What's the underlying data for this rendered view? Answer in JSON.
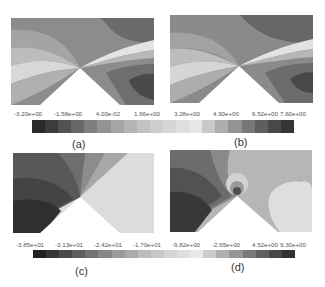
{
  "figure": {
    "panels": [
      {
        "id": "a",
        "label": "(a)"
      },
      {
        "id": "b",
        "label": "(b)"
      },
      {
        "id": "c",
        "label": "(c)"
      },
      {
        "id": "d",
        "label": "(d)"
      }
    ],
    "colorbar_top": {
      "ticks": [
        "-3.20e+00",
        "-1.58e+00",
        "4.00e-02",
        "1.66e+00",
        "3.28e+00",
        "4.90e+00",
        "6.52e+00",
        "7.60e+00"
      ],
      "colors": [
        "#2a2a2a",
        "#3c3c3c",
        "#525252",
        "#686868",
        "#7e7e7e",
        "#939393",
        "#a5a5a5",
        "#b4b4b4",
        "#c2c2c2",
        "#cdcdcd",
        "#d6d6d6",
        "#dedede",
        "#e6e6e6",
        "#c8c8c8",
        "#aeaeae",
        "#939393",
        "#777777",
        "#5e5e5e",
        "#484848",
        "#353535"
      ]
    },
    "colorbar_bottom": {
      "ticks": [
        "-3.85e+01",
        "-3.13e+01",
        "-2.42e+01",
        "-1.70e+01",
        "-9.82e+00",
        "-2.65e+00",
        "4.52e+00",
        "9.30e+00"
      ],
      "colors": [
        "#222222",
        "#363636",
        "#4a4a4a",
        "#5e5e5e",
        "#727272",
        "#878787",
        "#9a9a9a",
        "#ababab",
        "#bbbbbb",
        "#c8c8c8",
        "#d4d4d4",
        "#dedede",
        "#e8e8e8",
        "#cbcbcb",
        "#b0b0b0",
        "#959595",
        "#7a7a7a",
        "#5f5f5f",
        "#474747",
        "#323232"
      ]
    }
  }
}
